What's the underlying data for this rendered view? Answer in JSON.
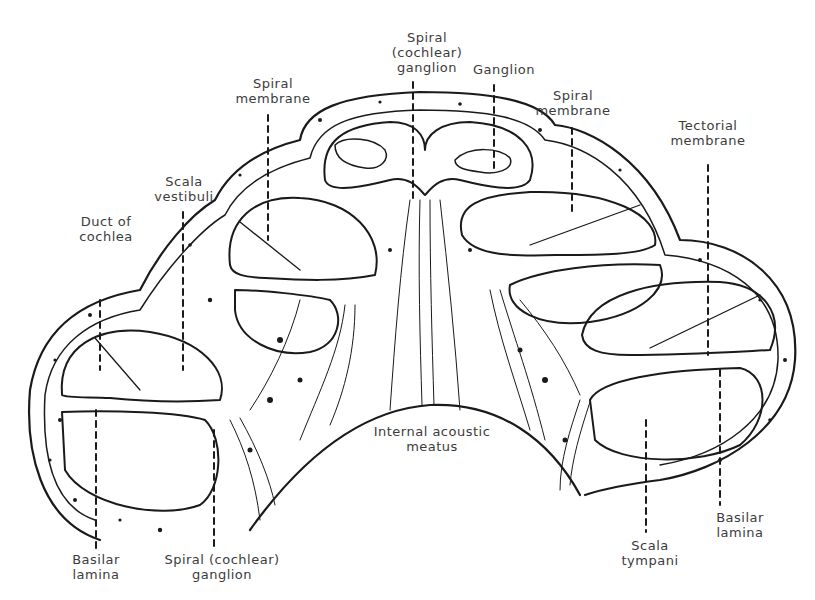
{
  "diagram": {
    "colors": {
      "ink": "#1a1a1a",
      "label": "#3c3c3c",
      "background": "#ffffff"
    },
    "labels": [
      {
        "id": "spiral-cochlear-ganglion-top",
        "text": "Spiral\n(cochlear)\nganglion",
        "x": 382,
        "y": 30,
        "w": 90
      },
      {
        "id": "ganglion",
        "text": "Ganglion",
        "x": 466,
        "y": 62,
        "w": 76
      },
      {
        "id": "spiral-membrane-left",
        "text": "Spiral\nmembrane",
        "x": 228,
        "y": 76,
        "w": 90
      },
      {
        "id": "spiral-membrane-right",
        "text": "Spiral\nmembrane",
        "x": 528,
        "y": 88,
        "w": 90
      },
      {
        "id": "tectorial-membrane",
        "text": "Tectorial\nmembrane",
        "x": 658,
        "y": 118,
        "w": 100
      },
      {
        "id": "scala-vestibuli",
        "text": "Scala\nvestibuli",
        "x": 146,
        "y": 174,
        "w": 76
      },
      {
        "id": "duct-of-cochlea",
        "text": "Duct of\ncochlea",
        "x": 68,
        "y": 214,
        "w": 76
      },
      {
        "id": "internal-acoustic-meatus",
        "text": "Internal acoustic\nmeatus",
        "x": 362,
        "y": 424,
        "w": 140
      },
      {
        "id": "basilar-lamina-right",
        "text": "Basilar\nlamina",
        "x": 704,
        "y": 510,
        "w": 72
      },
      {
        "id": "basilar-lamina-left",
        "text": "Basilar\nlamina",
        "x": 60,
        "y": 552,
        "w": 72
      },
      {
        "id": "spiral-cochlear-ganglion-bottom",
        "text": "Spiral (cochlear)\nganglion",
        "x": 152,
        "y": 552,
        "w": 140
      },
      {
        "id": "scala-tympani",
        "text": "Scala\ntympani",
        "x": 612,
        "y": 538,
        "w": 76
      }
    ]
  }
}
